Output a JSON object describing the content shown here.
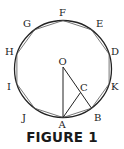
{
  "figure": {
    "caption": "FIGURE 1",
    "center_label": "O",
    "point_c_label": "C",
    "vertex_labels": {
      "A": "A",
      "B": "B",
      "K": "K",
      "D": "D",
      "E": "E",
      "F": "F",
      "G": "G",
      "H": "H",
      "I": "I",
      "J": "J"
    }
  }
}
